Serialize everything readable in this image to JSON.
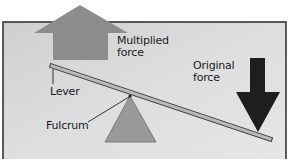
{
  "diagram": {
    "type": "lever",
    "labels": {
      "multiplied_force": "Multiplied\nforce",
      "original_force": "Original\nforce",
      "lever": "Lever",
      "fulcrum": "Fulcrum"
    },
    "colors": {
      "panel_background": "#d6d6d6",
      "panel_border": "#2a2a2a",
      "multiplied_force_arrow": "#8c8c8c",
      "original_force_arrow": "#1e1e1e",
      "lever_fill": "#b5b5b5",
      "lever_edge": "#444444",
      "fulcrum_fill": "#999999",
      "text": "#1a1a1a"
    }
  }
}
